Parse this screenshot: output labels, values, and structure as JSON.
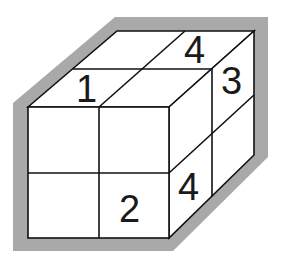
{
  "diagram": {
    "colors": {
      "background": "#ffffff",
      "shadow": "#a9a9a9",
      "lines": "#111111",
      "faces": "#ffffff"
    },
    "labels": {
      "top_front_left": "1",
      "top_back_right": "4",
      "right_top_back": "3",
      "right_bottom_front": "4",
      "front_bottom_right": "2"
    }
  }
}
